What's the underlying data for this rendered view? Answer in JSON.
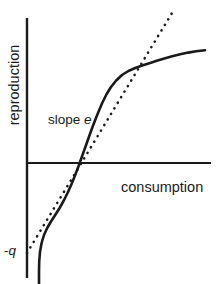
{
  "figure": {
    "background_color": "#ffffff",
    "ink_color": "#1a1a1a",
    "width": 219,
    "height": 284
  },
  "axes": {
    "y_axis_label": "reproduction",
    "x_axis_label": "consumption",
    "origin_x_px": 27,
    "origin_y_px": 163,
    "y_axis_top_px": 18,
    "y_axis_bottom_px": 278,
    "x_axis_right_px": 211
  },
  "annotations": {
    "slope_prefix": "slope ",
    "slope_symbol": "e",
    "intercept_prefix": "-",
    "intercept_symbol": "q"
  },
  "chart_data": {
    "type": "line",
    "title": "",
    "subtitle": "",
    "xlabel": "consumption",
    "ylabel": "reproduction",
    "grid": false,
    "legend": null,
    "axis_style": "crossed-axes-no-ticks",
    "xlim": [
      0,
      1
    ],
    "ylim": [
      -1,
      1
    ],
    "annotations": [
      {
        "text": "slope e",
        "symbol": "e",
        "meaning": "slope of the linear (middle) portion of the reproduction curve",
        "x_px": 48,
        "y_px": 120
      },
      {
        "text": "-q",
        "symbol": "q",
        "meaning": "y-intercept of the tangent line; maintenance cost when consumption is zero",
        "x_px": 12,
        "y_px": 251
      }
    ],
    "series": [
      {
        "name": "reproduction-curve",
        "style": "solid",
        "linewidth_px": 2.6,
        "description": "Sigmoid (S-shaped) reproduction response: steep rise from strongly negative values, a straight segment of slope e crossing zero, then saturating to a plateau.",
        "points_px": [
          [
            39.0,
            284.0
          ],
          [
            39.0,
            272.0
          ],
          [
            39.2,
            262.0
          ],
          [
            40.0,
            252.0
          ],
          [
            41.6,
            243.0
          ],
          [
            44.0,
            235.0
          ],
          [
            47.2,
            228.0
          ],
          [
            51.0,
            221.5
          ],
          [
            55.2,
            215.0
          ],
          [
            59.6,
            208.0
          ],
          [
            63.8,
            200.5
          ],
          [
            67.8,
            192.5
          ],
          [
            71.6,
            184.0
          ],
          [
            75.2,
            175.0
          ],
          [
            78.6,
            166.0
          ],
          [
            81.8,
            157.0
          ],
          [
            85.0,
            148.0
          ],
          [
            88.2,
            139.0
          ],
          [
            91.4,
            130.0
          ],
          [
            94.8,
            121.0
          ],
          [
            98.4,
            112.0
          ],
          [
            102.2,
            103.0
          ],
          [
            106.4,
            94.5
          ],
          [
            111.0,
            87.0
          ],
          [
            116.2,
            80.5
          ],
          [
            122.0,
            75.0
          ],
          [
            128.4,
            71.0
          ],
          [
            135.2,
            68.0
          ],
          [
            142.2,
            65.5
          ],
          [
            149.4,
            63.2
          ],
          [
            156.8,
            60.8
          ],
          [
            164.4,
            58.5
          ],
          [
            172.2,
            56.3
          ],
          [
            180.2,
            54.3
          ],
          [
            188.2,
            52.6
          ],
          [
            196.2,
            51.3
          ],
          [
            205.0,
            50.2
          ]
        ]
      },
      {
        "name": "tangent-line",
        "style": "dotted",
        "linewidth_px": 2.6,
        "description": "Dotted tangent of slope e drawn through the linear portion of the curve, meeting the y-axis at -q and extending beyond the saturation bend.",
        "points_px": [
          [
            27.0,
            253.0
          ],
          [
            172.0,
            13.0
          ]
        ]
      }
    ]
  }
}
